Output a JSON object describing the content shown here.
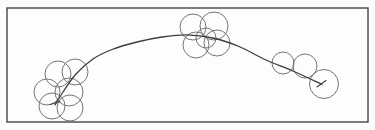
{
  "figure": {
    "background": "#fdfdfc",
    "frame": {
      "x": 7,
      "y": 8,
      "width": 361,
      "height": 114,
      "stroke": "#454545",
      "stroke_width": 1.4
    },
    "bubbles": {
      "stroke": "#767676",
      "stroke_width": 1,
      "clusters": [
        {
          "name": "left",
          "circles": [
            {
              "cx": 58,
              "cy": 74,
              "r": 13
            },
            {
              "cx": 75,
              "cy": 72,
              "r": 13
            },
            {
              "cx": 47,
              "cy": 92,
              "r": 13
            },
            {
              "cx": 69,
              "cy": 92,
              "r": 14
            },
            {
              "cx": 52,
              "cy": 106,
              "r": 13
            },
            {
              "cx": 70,
              "cy": 108,
              "r": 13
            }
          ]
        },
        {
          "name": "middle",
          "circles": [
            {
              "cx": 193,
              "cy": 27,
              "r": 13
            },
            {
              "cx": 214,
              "cy": 26,
              "r": 14
            },
            {
              "cx": 196,
              "cy": 45,
              "r": 13
            },
            {
              "cx": 217,
              "cy": 43,
              "r": 13
            },
            {
              "cx": 206,
              "cy": 38,
              "r": 10
            }
          ]
        },
        {
          "name": "right",
          "circles": [
            {
              "cx": 283,
              "cy": 63,
              "r": 11
            },
            {
              "cx": 305,
              "cy": 66,
              "r": 12
            },
            {
              "cx": 324,
              "cy": 84,
              "r": 14.5
            }
          ]
        }
      ]
    },
    "curve": {
      "color": "#3e3e3e",
      "stroke_width": 1.3,
      "points": [
        [
          55,
          105
        ],
        [
          63,
          92
        ],
        [
          76,
          74
        ],
        [
          93,
          59
        ],
        [
          112,
          49.5
        ],
        [
          137,
          42
        ],
        [
          162,
          37
        ],
        [
          187,
          34.8
        ],
        [
          213,
          38
        ],
        [
          239,
          46.5
        ],
        [
          266,
          60
        ],
        [
          294,
          71.5
        ],
        [
          322,
          84.5
        ]
      ],
      "end_ticks": [
        [
          [
            317,
            87
          ],
          [
            326,
            80.5
          ]
        ],
        [
          [
            50,
            104.5
          ],
          [
            60,
            101.5
          ]
        ]
      ]
    }
  }
}
